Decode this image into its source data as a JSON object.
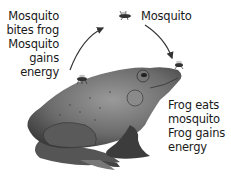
{
  "diagram": {
    "type": "cycle",
    "labels": {
      "left": [
        "Mosquito",
        "bites frog",
        "Mosquito",
        "gains",
        "energy"
      ],
      "top": "Mosquito",
      "right": [
        "Frog eats",
        "mosquito",
        "Frog gains",
        "energy"
      ]
    },
    "nodes": [
      {
        "id": "mosquito-on-frog",
        "icon": "mosquito-icon"
      },
      {
        "id": "mosquito-flying",
        "icon": "mosquito-icon"
      },
      {
        "id": "mosquito-at-mouth",
        "icon": "mosquito-icon"
      },
      {
        "id": "frog",
        "icon": "frog-icon"
      }
    ],
    "arrows": [
      {
        "from": "mosquito-on-frog",
        "to": "mosquito-flying"
      },
      {
        "from": "mosquito-flying",
        "to": "mosquito-at-mouth"
      }
    ]
  }
}
